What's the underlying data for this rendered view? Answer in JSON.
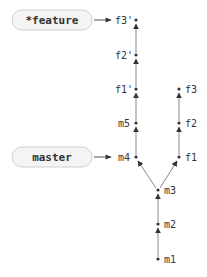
{
  "diagram": {
    "type": "git-commit-graph",
    "branches": [
      {
        "id": "feature",
        "label": "*feature",
        "current": true,
        "points_to": "f3'"
      },
      {
        "id": "master",
        "label": "master",
        "current": false,
        "points_to": "m4"
      }
    ],
    "commits": [
      {
        "id": "m1",
        "label": "m1"
      },
      {
        "id": "m2",
        "label": "m2"
      },
      {
        "id": "m3",
        "label": "m3"
      },
      {
        "id": "m4",
        "label": "m4"
      },
      {
        "id": "m5",
        "label": "m5"
      },
      {
        "id": "f1",
        "label": "f1"
      },
      {
        "id": "f2",
        "label": "f2"
      },
      {
        "id": "f3",
        "label": "f3"
      },
      {
        "id": "f1p",
        "label": "f1'"
      },
      {
        "id": "f2p",
        "label": "f2'"
      },
      {
        "id": "f3p",
        "label": "f3'"
      }
    ],
    "edges": [
      [
        "m1",
        "m2"
      ],
      [
        "m2",
        "m3"
      ],
      [
        "m3",
        "m4"
      ],
      [
        "m3",
        "f1"
      ],
      [
        "m4",
        "m5"
      ],
      [
        "m5",
        "f1'"
      ],
      [
        "f1'",
        "f2'"
      ],
      [
        "f2'",
        "f3'"
      ],
      [
        "f1",
        "f2"
      ],
      [
        "f2",
        "f3"
      ]
    ],
    "colors": {
      "edge": "#888888",
      "box_fill": "#f4f4f4",
      "box_stroke": "#cfcfcf",
      "text": "#333333"
    }
  }
}
